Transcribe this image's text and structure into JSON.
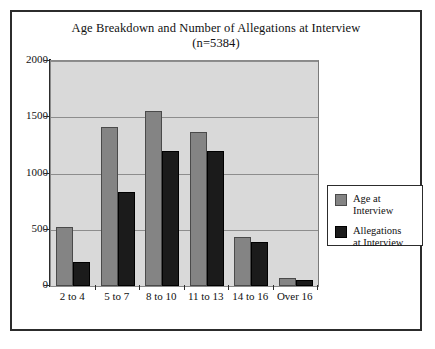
{
  "chart_data": {
    "type": "bar",
    "title": "Age Breakdown and Number of Allegations at Interview",
    "subtitle": "(n=5384)",
    "xlabel": "",
    "ylabel": "",
    "categories": [
      "2 to 4",
      "5 to 7",
      "8 to 10",
      "11 to 13",
      "14 to 16",
      "Over 16"
    ],
    "series": [
      {
        "name": "Age at Interview",
        "color": "#848484",
        "values": [
          525,
          1410,
          1560,
          1370,
          440,
          70
        ]
      },
      {
        "name": "Allegations at Interview",
        "color": "#1b1b1b",
        "values": [
          215,
          840,
          1200,
          1200,
          395,
          50
        ]
      }
    ],
    "ylim": [
      0,
      2000
    ],
    "yticks": [
      0,
      500,
      1000,
      1500,
      2000
    ],
    "ytick_labels": [
      "0",
      "500",
      "1000",
      "1500",
      "2000"
    ],
    "grid": true,
    "legend_position": "right",
    "plot_background": "#d9d9d9",
    "frame_border_color": "#2c2c2c"
  },
  "legend": {
    "entries": [
      {
        "label": "Age at Interview"
      },
      {
        "label": "Allegations\nat Interview"
      }
    ]
  }
}
